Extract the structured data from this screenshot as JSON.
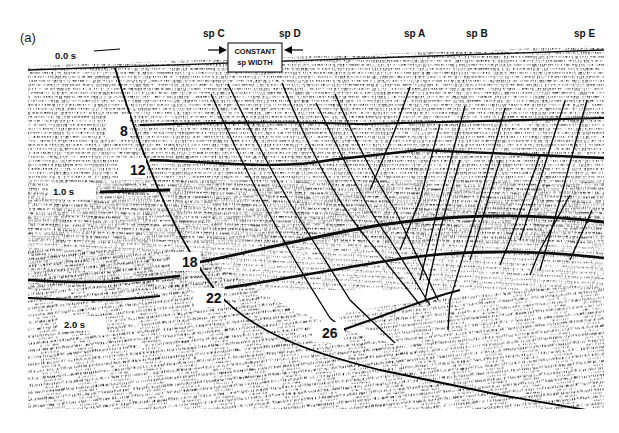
{
  "figure": {
    "panel_label": "(a)",
    "top_time_label": "0.0 s",
    "time_markers": [
      {
        "label": "0.0 s",
        "x": 55,
        "y": 55
      },
      {
        "label": "1.0 s",
        "x": 53,
        "y": 192
      },
      {
        "label": "2.0 s",
        "x": 64,
        "y": 325
      }
    ],
    "shotpoints": [
      {
        "label": "sp C",
        "x": 203,
        "y": 37
      },
      {
        "label": "sp D",
        "x": 279,
        "y": 37
      },
      {
        "label": "sp A",
        "x": 404,
        "y": 37
      },
      {
        "label": "sp B",
        "x": 466,
        "y": 37
      },
      {
        "label": "sp E",
        "x": 574,
        "y": 37
      }
    ],
    "constant_box": {
      "line1": "CONSTANT",
      "line2": "sp WIDTH"
    },
    "horizon_labels": [
      {
        "label": "8",
        "x": 120,
        "y": 136
      },
      {
        "label": "12",
        "x": 130,
        "y": 175
      },
      {
        "label": "18",
        "x": 182,
        "y": 267
      },
      {
        "label": "22",
        "x": 206,
        "y": 303
      },
      {
        "label": "26",
        "x": 322,
        "y": 338
      }
    ],
    "colors": {
      "ink": "#111111",
      "paper": "#ffffff",
      "label_box": "#ffffff"
    }
  }
}
